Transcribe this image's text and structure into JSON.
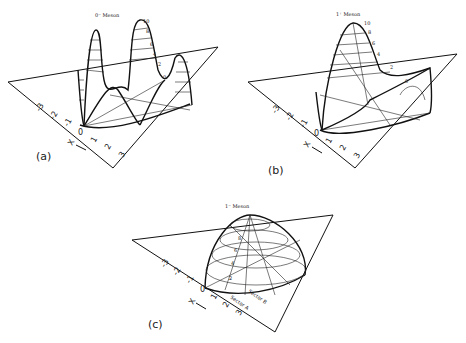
{
  "figure": {
    "panels": [
      {
        "id": "a",
        "label": "(a)",
        "title": "0⁻ Meson",
        "height_ticks": [
          "10",
          "8",
          "6",
          "4",
          "2",
          "0"
        ],
        "axis_ticks": [
          "-3",
          "-2",
          "-1",
          "0",
          "1",
          "2",
          "3"
        ],
        "axis_label": "X"
      },
      {
        "id": "b",
        "label": "(b)",
        "title": "1⁺ Meson",
        "height_ticks": [
          "10",
          "8",
          "6",
          "4",
          "2",
          "0"
        ],
        "axis_ticks": [
          "-3",
          "-2",
          "-1",
          "0",
          "1",
          "2",
          "3"
        ],
        "axis_label": "X"
      },
      {
        "id": "c",
        "label": "(c)",
        "title": "1⁻ Meson",
        "height_ticks": [
          "8",
          "6",
          "4",
          "2"
        ],
        "axis_ticks": [
          "-3",
          "-2",
          "-1",
          "0",
          "1",
          "2",
          "3"
        ],
        "axis_label": "X",
        "annotations": [
          "Sector A",
          "Sector B"
        ]
      }
    ]
  }
}
